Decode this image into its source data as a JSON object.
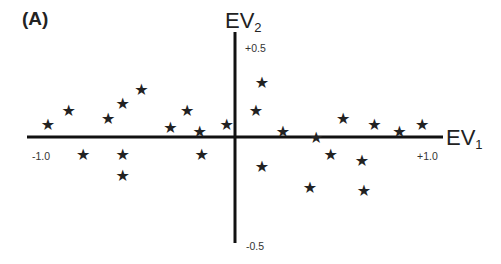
{
  "panel_label": "(A)",
  "axes": {
    "x_title": "EV",
    "x_sub": "1",
    "y_title": "EV",
    "y_sub": "2",
    "x_min_label": "-1.0",
    "x_max_label": "+1.0",
    "y_max_label": "+0.5",
    "y_min_label": "-0.5"
  },
  "colors": {
    "axis": "#111111",
    "marker": "#222222",
    "text": "#222222"
  },
  "chart_data": {
    "type": "scatter",
    "title": "(A)",
    "xlabel": "EV1",
    "ylabel": "EV2",
    "xlim": [
      -1.0,
      1.0
    ],
    "ylim": [
      -0.5,
      0.5
    ],
    "grid": false,
    "marker": "*",
    "tick_labels": {
      "x": [
        "-1.0",
        "+1.0"
      ],
      "y": [
        "+0.5",
        "-0.5"
      ]
    },
    "points": [
      {
        "x": -0.9,
        "y": 0.06
      },
      {
        "x": -0.8,
        "y": 0.13
      },
      {
        "x": -0.61,
        "y": 0.09
      },
      {
        "x": -0.54,
        "y": 0.16
      },
      {
        "x": -0.45,
        "y": 0.23
      },
      {
        "x": -0.31,
        "y": 0.05
      },
      {
        "x": -0.23,
        "y": 0.13
      },
      {
        "x": -0.17,
        "y": 0.03
      },
      {
        "x": -0.04,
        "y": 0.06
      },
      {
        "x": -0.73,
        "y": -0.08
      },
      {
        "x": -0.54,
        "y": -0.08
      },
      {
        "x": -0.54,
        "y": -0.18
      },
      {
        "x": -0.16,
        "y": -0.08
      },
      {
        "x": 0.13,
        "y": 0.26
      },
      {
        "x": 0.1,
        "y": 0.13
      },
      {
        "x": 0.23,
        "y": 0.03
      },
      {
        "x": 0.52,
        "y": 0.09
      },
      {
        "x": 0.67,
        "y": 0.06
      },
      {
        "x": 0.79,
        "y": 0.03
      },
      {
        "x": 0.9,
        "y": 0.06
      },
      {
        "x": 0.13,
        "y": -0.14
      },
      {
        "x": 0.39,
        "y": 0.0
      },
      {
        "x": 0.46,
        "y": -0.08
      },
      {
        "x": 0.61,
        "y": -0.11
      },
      {
        "x": 0.36,
        "y": -0.24
      },
      {
        "x": 0.62,
        "y": -0.25
      }
    ]
  }
}
